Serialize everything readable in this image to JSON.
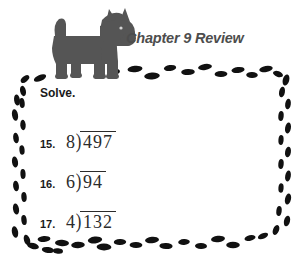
{
  "page": {
    "background_color": "#ffffff",
    "border_style": "scattered-oval-dots",
    "border_color": "#111111"
  },
  "header": {
    "title": "Chapter 9 Review",
    "title_color": "#4d4d4d",
    "mascot": "scottish-terrier-dog",
    "mascot_color": "#555555"
  },
  "directions": {
    "text": "Solve."
  },
  "problems": [
    {
      "number": "15.",
      "divisor": "8",
      "bracket": ")",
      "dividend": "497"
    },
    {
      "number": "16.",
      "divisor": "6",
      "bracket": ")",
      "dividend": "94"
    },
    {
      "number": "17.",
      "divisor": "4",
      "bracket": ")",
      "dividend": "132"
    }
  ]
}
